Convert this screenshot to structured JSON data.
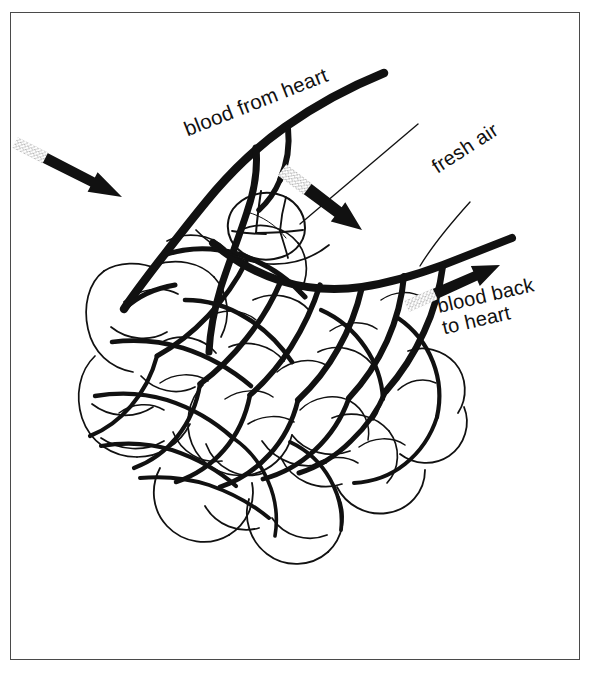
{
  "figure": {
    "name": "lung-alveoli-gas-exchange-diagram",
    "background_color": "#ffffff",
    "ink_color": "#111111",
    "border_color": "#4a4a4a"
  },
  "labels": {
    "blood_from_heart": "blood from heart",
    "fresh_air": "fresh air",
    "blood_back_line1": "blood back",
    "blood_back_line2": "to heart"
  },
  "arrows": [
    {
      "name": "blood-from-heart-arrow",
      "label": "blood from heart",
      "direction": "down-left",
      "style": "solid-thick-black"
    },
    {
      "name": "fresh-air-arrow",
      "label": "fresh air",
      "direction": "down-left",
      "style": "solid-thick-black"
    },
    {
      "name": "blood-back-to-heart-arrow",
      "label": "blood back to heart",
      "direction": "up-right",
      "style": "solid-thick-black"
    }
  ],
  "leader_lines": [
    {
      "name": "fresh-air-leader-line",
      "points_to": "alveolus-detail"
    },
    {
      "name": "blood-back-leader-line",
      "points_to": "pulmonary-vein-trunk"
    }
  ],
  "structures": [
    {
      "name": "pulmonary-artery",
      "role": "blood from heart"
    },
    {
      "name": "pulmonary-vein",
      "role": "blood back to heart"
    },
    {
      "name": "alveoli-cluster",
      "role": "air sacs"
    },
    {
      "name": "capillary-network",
      "role": "gas exchange vessels"
    },
    {
      "name": "alveolus-detail",
      "role": "single highlighted air sac"
    }
  ]
}
